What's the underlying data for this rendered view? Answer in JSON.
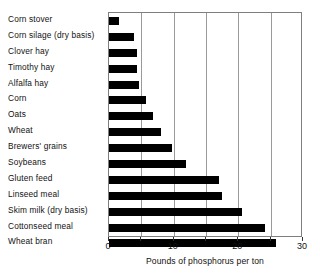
{
  "chart_data": {
    "type": "bar",
    "orientation": "horizontal",
    "title": "",
    "xlabel": "Pounds of phosphorus per ton",
    "ylabel": "",
    "xlim": [
      0,
      30
    ],
    "xticks": [
      0,
      10,
      20,
      30
    ],
    "xtick_labels": [
      "0",
      "10",
      "20",
      "30"
    ],
    "minor_gridlines": [
      5,
      15,
      25
    ],
    "grid": true,
    "legend": null,
    "categories": [
      "Corn stover",
      "Corn silage (dry basis)",
      "Clover hay",
      "Timothy hay",
      "Alfalfa hay",
      "Corn",
      "Oats",
      "Wheat",
      "Brewers' grains",
      "Soybeans",
      "Gluten feed",
      "Linseed meal",
      "Skim milk (dry basis)",
      "Cottonseed meal",
      "Wheat bran"
    ],
    "values": [
      1.5,
      3.9,
      4.4,
      4.4,
      4.7,
      5.7,
      6.8,
      8.0,
      9.7,
      11.9,
      17.0,
      17.4,
      20.6,
      24.1,
      25.8
    ]
  }
}
